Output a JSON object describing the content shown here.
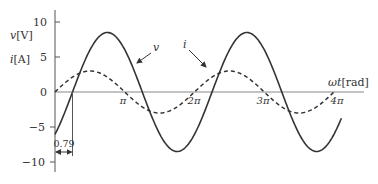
{
  "chart_data": {
    "type": "line",
    "title": "",
    "xlabel": "ωt[rad]",
    "ylabel_v": "v[V]",
    "ylabel_i": "i[A]",
    "x_ticks": [
      "π",
      "2π",
      "3π",
      "4π"
    ],
    "x_tick_values": [
      3.1416,
      6.2832,
      9.4248,
      12.5664
    ],
    "y_ticks": [
      "10",
      "5",
      "0",
      "−5",
      "−10"
    ],
    "y_tick_values": [
      10,
      5,
      0,
      -5,
      -10
    ],
    "xlim": [
      0,
      13.5
    ],
    "ylim": [
      -11.5,
      12
    ],
    "grid": false,
    "legend": "none (inline arrow labels)",
    "series": [
      {
        "name": "v",
        "style": "solid",
        "formula": "8.5 sin(ωt − 0.79)",
        "amplitude": 8.5,
        "phase_rad": -0.79,
        "x_range": [
          0,
          12.9
        ],
        "points": [
          [
            0,
            -6.0
          ],
          [
            0.79,
            0
          ],
          [
            2.36,
            8.5
          ],
          [
            3.93,
            0
          ],
          [
            5.5,
            -8.5
          ],
          [
            7.07,
            0
          ],
          [
            8.64,
            8.5
          ],
          [
            10.22,
            0
          ],
          [
            11.79,
            -8.5
          ],
          [
            12.9,
            -6.0
          ]
        ]
      },
      {
        "name": "i",
        "style": "dashed",
        "formula": "3 sin(ωt)",
        "amplitude": 3,
        "phase_rad": 0,
        "x_range": [
          0,
          12.57
        ],
        "points": [
          [
            0,
            0
          ],
          [
            1.57,
            3
          ],
          [
            3.14,
            0
          ],
          [
            4.71,
            -3
          ],
          [
            6.28,
            0
          ],
          [
            7.85,
            3
          ],
          [
            9.42,
            0
          ],
          [
            10.99,
            -3
          ],
          [
            12.57,
            0
          ]
        ]
      }
    ],
    "annotations": [
      {
        "text": "v",
        "target_series": "v",
        "type": "arrow-label"
      },
      {
        "text": "i",
        "target_series": "i",
        "type": "arrow-label"
      },
      {
        "text": "0.79",
        "type": "dimension",
        "from": 0,
        "to": 0.79
      }
    ]
  },
  "labels": {
    "y_v": "v",
    "y_v_unit": "[V]",
    "y_i": "i",
    "y_i_unit": "[A]",
    "x_axis": "ωt",
    "x_axis_unit": "[rad]",
    "tick_10": "10",
    "tick_5": "5",
    "tick_0": "0",
    "tick_m5": "−5",
    "tick_m10": "−10",
    "tick_pi": "π",
    "tick_2pi": "2π",
    "tick_3pi": "3π",
    "tick_4pi": "4π",
    "series_v": "v",
    "series_i": "i",
    "phase_shift": "0.79"
  }
}
